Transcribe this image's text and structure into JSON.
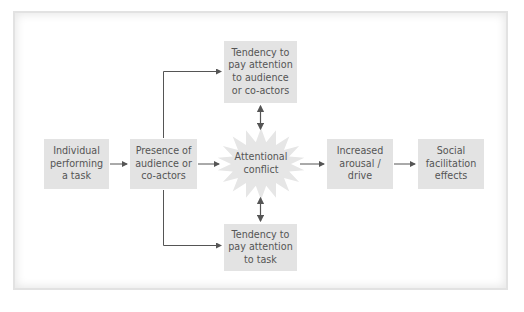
{
  "diagram": {
    "type": "flowchart",
    "colors": {
      "box_fill": "#e3e3e3",
      "burst_fill": "#e6e6e6",
      "text": "#555555",
      "connector": "#555555",
      "frame_border": "#e2e2e2"
    },
    "nodes": {
      "individual": {
        "label": "Individual\nperforming\na task"
      },
      "presence": {
        "label": "Presence of\naudience or\nco-actors"
      },
      "attend_audience": {
        "label": "Tendency to\npay attention\nto audience\nor co-actors"
      },
      "conflict": {
        "label": "Attentional\nconflict",
        "shape": "starburst"
      },
      "attend_task": {
        "label": "Tendency to\npay attention\nto task"
      },
      "arousal": {
        "label": "Increased\narousal /\ndrive"
      },
      "social": {
        "label": "Social\nfacilitation\neffects"
      }
    },
    "edges": [
      {
        "from": "individual",
        "to": "presence",
        "type": "arrow"
      },
      {
        "from": "presence",
        "to": "conflict",
        "type": "arrow"
      },
      {
        "from": "presence",
        "to": "attend_audience",
        "type": "elbow-arrow"
      },
      {
        "from": "presence",
        "to": "attend_task",
        "type": "elbow-arrow"
      },
      {
        "from": "attend_audience",
        "to": "conflict",
        "type": "double-arrow"
      },
      {
        "from": "attend_task",
        "to": "conflict",
        "type": "double-arrow"
      },
      {
        "from": "conflict",
        "to": "arousal",
        "type": "arrow"
      },
      {
        "from": "arousal",
        "to": "social",
        "type": "arrow"
      }
    ]
  }
}
